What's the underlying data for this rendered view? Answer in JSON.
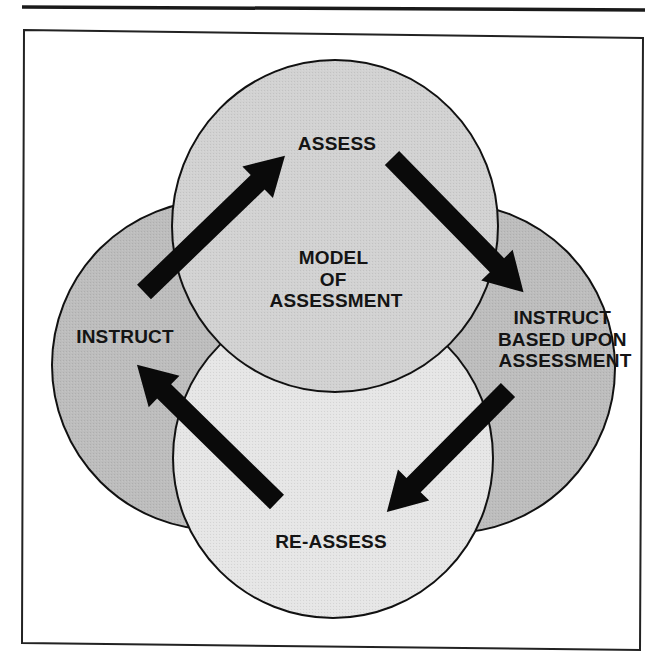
{
  "diagram": {
    "title": "Model of Assessment",
    "center_label": {
      "lines": [
        "MODEL",
        "OF",
        "ASSESSMENT"
      ]
    },
    "nodes": [
      {
        "id": "assess",
        "label_lines": [
          "ASSESS"
        ],
        "fill": "#d2d2d2"
      },
      {
        "id": "instruct-based",
        "label_lines": [
          "INSTRUCT",
          "BASED UPON",
          "ASSESSMENT"
        ],
        "fill": "#bdbdbd"
      },
      {
        "id": "re-assess",
        "label_lines": [
          "RE-ASSESS"
        ],
        "fill": "#e6e6e6"
      },
      {
        "id": "instruct",
        "label_lines": [
          "INSTRUCT"
        ],
        "fill": "#bdbdbd"
      }
    ],
    "edges": [
      {
        "from": "instruct",
        "to": "assess"
      },
      {
        "from": "assess",
        "to": "instruct-based"
      },
      {
        "from": "instruct-based",
        "to": "re-assess"
      },
      {
        "from": "re-assess",
        "to": "instruct"
      }
    ],
    "colors": {
      "stroke": "#111111",
      "arrow": "#0a0a0a",
      "frame": "#222222",
      "background": "#ffffff"
    }
  }
}
